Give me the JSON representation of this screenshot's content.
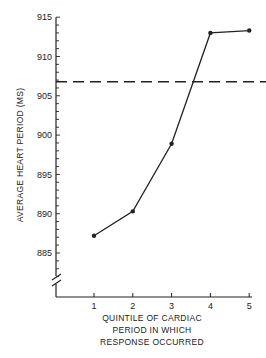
{
  "chart_data": {
    "type": "line",
    "title": "",
    "xlabel": "QUINTILE OF CARDIAC PERIOD IN WHICH RESPONSE OCCURRED",
    "xlabel_lines": [
      "QUINTILE OF CARDIAC",
      "PERIOD IN WHICH",
      "RESPONSE OCCURRED"
    ],
    "ylabel": "AVERAGE HEART PERIOD (MS)",
    "x": [
      1,
      2,
      3,
      4,
      5
    ],
    "x_tick_labels": [
      "1",
      "2",
      "3",
      "4",
      "5"
    ],
    "y_tick_labels": [
      "915",
      "910",
      "905",
      "900",
      "895",
      "890",
      "885"
    ],
    "y_ticks": [
      915,
      910,
      905,
      900,
      895,
      890,
      885
    ],
    "ylim": [
      880,
      915
    ],
    "y_axis_break": true,
    "grid": false,
    "legend": null,
    "series": [
      {
        "name": "Average heart period",
        "values": [
          887.2,
          890.3,
          898.9,
          913.0,
          913.3
        ],
        "style": "solid line with dot markers",
        "color": "#222222"
      }
    ],
    "reference_lines": [
      {
        "orientation": "horizontal",
        "value": 906.8,
        "style": "dashed",
        "color": "#222222"
      }
    ]
  }
}
